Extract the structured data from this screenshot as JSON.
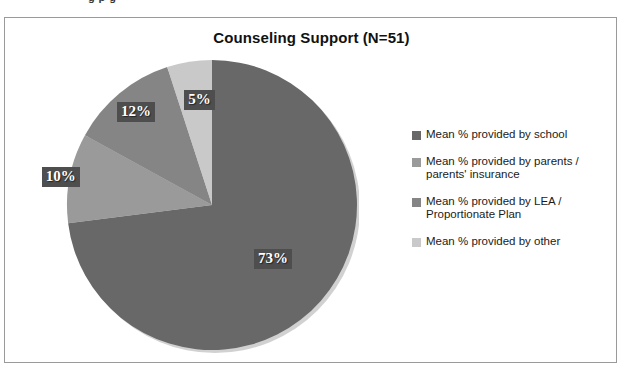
{
  "page": {
    "bleed_text": "g      p        g"
  },
  "chart": {
    "title": "Counseling Support (N=51)"
  },
  "legend": {
    "items": [
      {
        "label": "Mean % provided by school",
        "color": "#686868"
      },
      {
        "label": "Mean % provided by parents /\nparents' insurance",
        "color": "#9a9a9a"
      },
      {
        "label": "Mean % provided by LEA /\nProportionate Plan",
        "color": "#858585"
      },
      {
        "label": "Mean % provided by other",
        "color": "#c9c9c9"
      }
    ]
  },
  "chart_data": {
    "type": "pie",
    "title": "Counseling Support (N=51)",
    "n": 51,
    "legend_position": "right",
    "start_angle_deg": 0,
    "direction": "clockwise",
    "labels": [
      "Mean % provided by school",
      "Mean % provided by parents / parents' insurance",
      "Mean % provided by LEA / Proportionate Plan",
      "Mean % provided by other"
    ],
    "values": [
      73,
      10,
      12,
      5
    ],
    "value_labels": [
      "73%",
      "10%",
      "12%",
      "5%"
    ],
    "colors": [
      "#686868",
      "#9a9a9a",
      "#858585",
      "#c9c9c9"
    ],
    "slices": [
      {
        "label": "Mean % provided by school",
        "value": 73,
        "display": "73%",
        "color": "#686868"
      },
      {
        "label": "Mean % provided by parents / parents' insurance",
        "value": 10,
        "display": "10%",
        "color": "#9a9a9a"
      },
      {
        "label": "Mean % provided by LEA / Proportionate Plan",
        "value": 12,
        "display": "12%",
        "color": "#858585"
      },
      {
        "label": "Mean % provided by other",
        "value": 5,
        "display": "5%",
        "color": "#c9c9c9"
      }
    ]
  }
}
